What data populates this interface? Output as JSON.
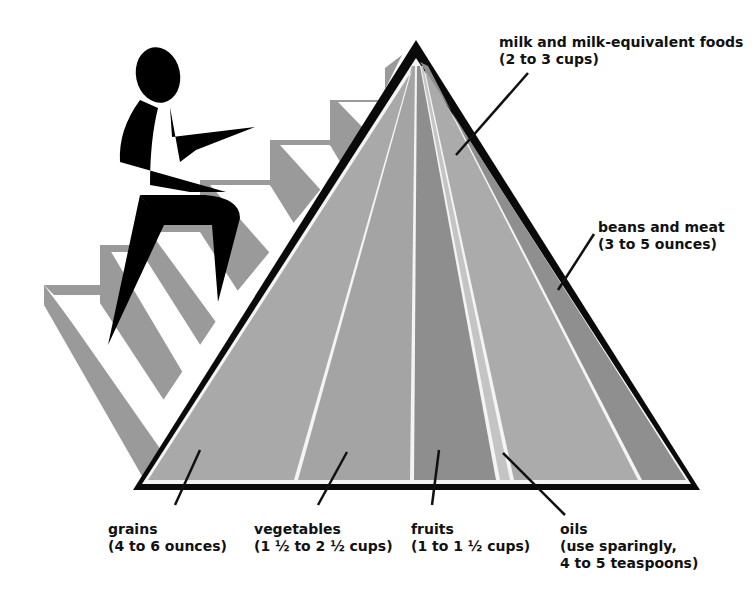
{
  "diagram": {
    "type": "food-pyramid",
    "colors": {
      "outline": "#0a0a0a",
      "divider": "#f4f4f4",
      "grains": "#a9a9a9",
      "vegetables": "#a4a4a4",
      "fruits": "#8e8e8e",
      "oils": "#c4c4c4",
      "milk": "#ababab",
      "meat_beans": "#8f8f8f",
      "stairs_light": "#ffffff",
      "stairs_dark": "#9a9a9a",
      "figure": "#000000"
    },
    "groups": [
      {
        "id": "grains",
        "name": "grains",
        "amount": "(4 to 6 ounces)"
      },
      {
        "id": "vegetables",
        "name": "vegetables",
        "amount": "(1 ½ to 2 ½ cups)"
      },
      {
        "id": "fruits",
        "name": "fruits",
        "amount": "(1 to 1 ½ cups)"
      },
      {
        "id": "oils",
        "name": "oils",
        "amount": "(use sparingly,",
        "amount2": "4 to 5 teaspoons)"
      },
      {
        "id": "milk",
        "name": "milk and milk-equivalent foods",
        "amount": "(2 to 3 cups)"
      },
      {
        "id": "meat",
        "name": "beans and meat",
        "amount": "(3 to 5 ounces)"
      }
    ]
  }
}
